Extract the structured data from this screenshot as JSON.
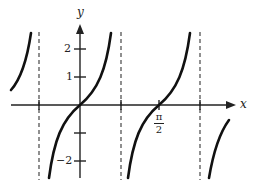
{
  "figure": {
    "axes": {
      "x_label": "x",
      "y_label": "y",
      "y_ticks": [
        {
          "value": 2,
          "label": "2"
        },
        {
          "value": 1,
          "label": "1"
        },
        {
          "value": -1,
          "label": ""
        },
        {
          "value": -2,
          "label": "−2"
        }
      ],
      "x_ticks": [
        {
          "value": "π/2",
          "label_num": "π",
          "label_den": "2"
        }
      ]
    },
    "asymptotes_note": "dashed vertical lines at three asymptotes",
    "colors": {
      "curve": "#111111",
      "axis": "#222222",
      "asymptote": "#555555"
    }
  }
}
